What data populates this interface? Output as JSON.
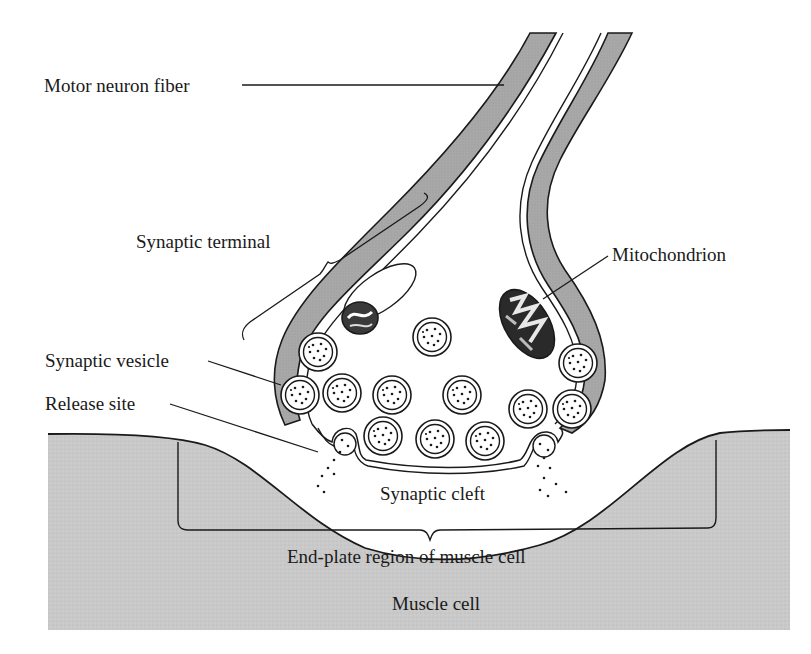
{
  "diagram": {
    "colors": {
      "membrane_fill": "#a8a8a8",
      "muscle_fill": "#c9c9c9",
      "ink": "#1a1a1a",
      "background": "#ffffff"
    },
    "labels": {
      "motor_neuron_fiber": "Motor neuron fiber",
      "synaptic_terminal": "Synaptic terminal",
      "mitochondrion": "Mitochondrion",
      "synaptic_vesicle": "Synaptic vesicle",
      "release_site": "Release site",
      "synaptic_cleft": "Synaptic cleft",
      "end_plate_region": "End-plate region of muscle cell",
      "muscle_cell": "Muscle cell"
    }
  }
}
